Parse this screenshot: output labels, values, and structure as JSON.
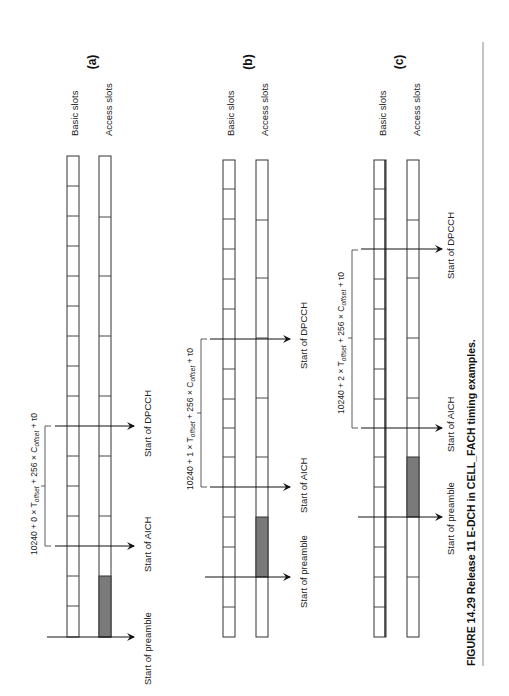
{
  "figure": {
    "caption": "FIGURE 14.29  Release 11 E-DCH in CELL_FACH timing examples.",
    "orientation": "rotated 90° counter-clockwise",
    "colors": {
      "line": "#333333",
      "fill_preamble": "#7a7a7a",
      "background": "#ffffff"
    }
  },
  "labels": {
    "basic_slots": "Basic slots",
    "access_slots": "Access slots",
    "start_preamble": "Start of preamble",
    "start_aich": "Start of AICH",
    "start_dpcch": "Start of DPCCH"
  },
  "panels": [
    {
      "id": "a",
      "label": "(a)",
      "formula": {
        "prefix": "10240 + 0 × T",
        "sub1": "offset",
        "mid": " + 256 × C",
        "sub2": "offset",
        "suffix": " + τ0"
      },
      "multiplier": 0
    },
    {
      "id": "b",
      "label": "(b)",
      "formula": {
        "prefix": "10240 + 1 × T",
        "sub1": "offset",
        "mid": " + 256 × C",
        "sub2": "offset",
        "suffix": " + τ0"
      },
      "multiplier": 1
    },
    {
      "id": "c",
      "label": "(c)",
      "formula": {
        "prefix": "10240 + 2 × T",
        "sub1": "offset",
        "mid": " + 256 × C",
        "sub2": "offset",
        "suffix": " + τ0"
      },
      "multiplier": 2
    }
  ]
}
